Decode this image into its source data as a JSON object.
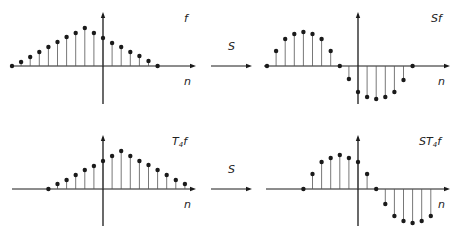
{
  "figure": {
    "operator_label": "S",
    "colors": {
      "ink": "#1a1a1a",
      "stem": "#555555",
      "background": "#ffffff"
    },
    "panels": [
      {
        "id": "f",
        "title": "f",
        "title_base": "f",
        "title_sub": "",
        "title_prefix": "",
        "axis_label": "n",
        "origin": [
          103,
          66
        ],
        "spacing": 9.1,
        "x_range": [
          10,
          196
        ],
        "y_range": [
          12,
          104
        ],
        "n_start": -10,
        "values": [
          0,
          4,
          9,
          14,
          19,
          24,
          29,
          33,
          38,
          33,
          28,
          23,
          19,
          14,
          10,
          5,
          0
        ]
      },
      {
        "id": "Sf",
        "title": "Sf",
        "title_base": "f",
        "title_sub": "",
        "title_prefix": "S",
        "axis_label": "n",
        "origin": [
          358,
          66
        ],
        "spacing": 9.1,
        "x_range": [
          264,
          450
        ],
        "y_range": [
          12,
          104
        ],
        "n_start": -10,
        "values": [
          0,
          15,
          27,
          32,
          34,
          32,
          27,
          15,
          0,
          -13,
          -26,
          -31,
          -33,
          -31,
          -26,
          -14,
          0
        ]
      },
      {
        "id": "T4f",
        "title": "T4f",
        "title_base": "f",
        "title_sub": "4",
        "title_prefix": "T",
        "axis_label": "n",
        "origin": [
          103,
          189
        ],
        "spacing": 9.1,
        "x_range": [
          12,
          196
        ],
        "y_range": [
          135,
          226
        ],
        "n_start": -6,
        "values": [
          0,
          5,
          9,
          14,
          19,
          23,
          28,
          33,
          38,
          33,
          28,
          24,
          19,
          14,
          9,
          5
        ]
      },
      {
        "id": "ST4f",
        "title": "ST4f",
        "title_base": "f",
        "title_sub": "4",
        "title_prefix": "ST",
        "axis_label": "n",
        "origin": [
          358,
          189
        ],
        "spacing": 9.1,
        "x_range": [
          266,
          450
        ],
        "y_range": [
          135,
          226
        ],
        "n_start": -6,
        "values": [
          0,
          15,
          27,
          31,
          34,
          31,
          27,
          15,
          0,
          -15,
          -27,
          -32,
          -34,
          -32,
          -27
        ]
      }
    ],
    "arrows": [
      {
        "id": "arrow-top",
        "label": "S",
        "x1": 211,
        "x2": 252,
        "y": 66,
        "label_x": 228,
        "label_y": 50
      },
      {
        "id": "arrow-bottom",
        "label": "S",
        "x1": 211,
        "x2": 252,
        "y": 189,
        "label_x": 228,
        "label_y": 173
      }
    ]
  }
}
